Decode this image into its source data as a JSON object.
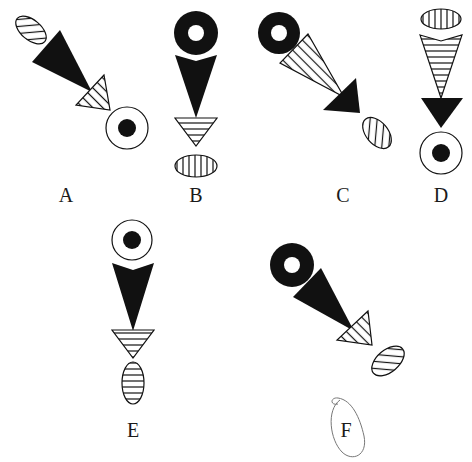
{
  "figure": {
    "type": "visual-reasoning-options",
    "colors": {
      "ink": "#111111",
      "background": "#ffffff",
      "annotation": "#777777"
    },
    "options": [
      {
        "label": "A",
        "elements": [
          "hatched-ellipse",
          "black-triangle",
          "hatched-triangle",
          "ringed-dot-circle"
        ]
      },
      {
        "label": "B",
        "elements": [
          "black-donut",
          "black-triangle",
          "hatched-triangle",
          "hatched-ellipse"
        ]
      },
      {
        "label": "C",
        "elements": [
          "black-donut",
          "hatched-triangle",
          "black-triangle",
          "hatched-ellipse"
        ]
      },
      {
        "label": "D",
        "elements": [
          "hatched-ellipse",
          "hatched-triangle",
          "black-triangle",
          "ringed-dot-circle"
        ]
      },
      {
        "label": "E",
        "elements": [
          "ringed-dot-circle",
          "black-triangle",
          "hatched-triangle",
          "hatched-ellipse"
        ]
      },
      {
        "label": "F",
        "elements": [
          "black-donut",
          "black-triangle",
          "hatched-triangle",
          "hatched-ellipse"
        ],
        "circled": true
      }
    ]
  }
}
